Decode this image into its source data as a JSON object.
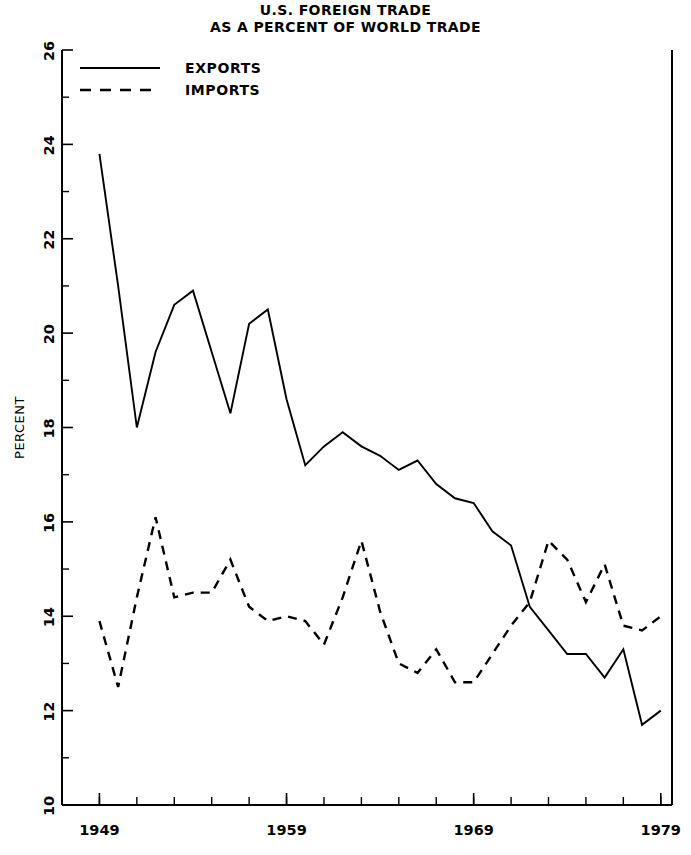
{
  "chart_data": {
    "type": "line",
    "title": "U.S. FOREIGN TRADE",
    "subtitle": "AS A PERCENT OF WORLD TRADE",
    "xlabel": "",
    "ylabel": "PERCENT",
    "xlim": [
      1947,
      1979.6
    ],
    "ylim": [
      10,
      26
    ],
    "grid": false,
    "legend_position": "top-left",
    "x_tick_labels": [
      "1949",
      "1959",
      "1969",
      "1979"
    ],
    "x_tick_values": [
      1949,
      1959,
      1969,
      1979
    ],
    "x_minor_tick_step": 2,
    "y_tick_labels": [
      "10",
      "12",
      "14",
      "16",
      "18",
      "20",
      "22",
      "24",
      "26"
    ],
    "y_tick_values": [
      10,
      12,
      14,
      16,
      18,
      20,
      22,
      24,
      26
    ],
    "y_minor_tick_step": 1,
    "x": [
      1949,
      1950,
      1951,
      1952,
      1953,
      1954,
      1955,
      1956,
      1957,
      1958,
      1959,
      1960,
      1961,
      1962,
      1963,
      1964,
      1965,
      1966,
      1967,
      1968,
      1969,
      1970,
      1971,
      1972,
      1973,
      1974,
      1975,
      1976,
      1977,
      1978,
      1979
    ],
    "series": [
      {
        "name": "EXPORTS",
        "style": "solid",
        "values": [
          23.8,
          21.0,
          18.0,
          19.6,
          20.6,
          20.9,
          19.6,
          18.3,
          20.2,
          20.5,
          18.6,
          17.2,
          17.6,
          17.9,
          17.6,
          17.4,
          17.1,
          17.3,
          16.8,
          16.5,
          16.4,
          15.8,
          15.5,
          14.2,
          13.7,
          13.2,
          13.2,
          12.7,
          13.3,
          11.7,
          12.0
        ]
      },
      {
        "name": "IMPORTS",
        "style": "dashed",
        "values": [
          13.9,
          12.5,
          14.4,
          16.1,
          14.4,
          14.5,
          14.5,
          15.2,
          14.2,
          13.9,
          14.0,
          13.9,
          13.4,
          14.4,
          15.6,
          14.1,
          13.0,
          12.8,
          13.3,
          12.6,
          12.6,
          13.2,
          13.8,
          14.3,
          15.6,
          15.2,
          14.3,
          15.1,
          13.8,
          13.7,
          14.0
        ]
      }
    ]
  },
  "legend": {
    "items": [
      {
        "label": "EXPORTS",
        "style": "solid"
      },
      {
        "label": "IMPORTS",
        "style": "dashed"
      }
    ]
  }
}
